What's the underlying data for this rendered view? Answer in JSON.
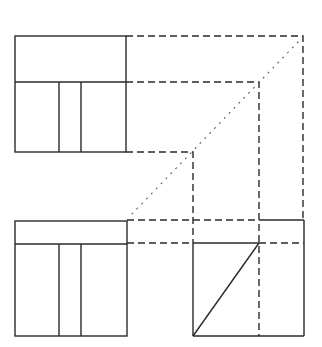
{
  "diagram": {
    "type": "orthographic-projection",
    "colors": {
      "line": "#2a2a2a",
      "miter": "#555555",
      "background": "#ffffff"
    },
    "views": [
      {
        "name": "top-view",
        "position": "top-left"
      },
      {
        "name": "front-view",
        "position": "bottom-left"
      },
      {
        "name": "side-view",
        "position": "bottom-right"
      }
    ],
    "line_types": [
      "solid",
      "dashed",
      "dotted"
    ]
  }
}
